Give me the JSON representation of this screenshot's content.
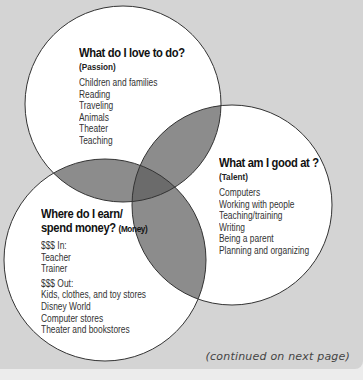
{
  "diagram": {
    "type": "venn",
    "colors": {
      "background": "#d4d4d4",
      "circle_fill": "#ffffff",
      "overlap_pair": "#8c8c8c",
      "overlap_triple": "#6b6b6b",
      "stroke": "#333333"
    },
    "passion": {
      "title": "What do I love to do?",
      "subtitle": "(Passion)",
      "items": [
        "Children and families",
        "Reading",
        "Traveling",
        "Animals",
        "Theater",
        "Teaching"
      ]
    },
    "talent": {
      "title": "What am I good at ?",
      "subtitle": "(Talent)",
      "items": [
        "Computers",
        "Working with people",
        "Teaching/training",
        "Writing",
        "Being a parent",
        "Planning and organizing"
      ]
    },
    "money": {
      "title_line1": "Where do I earn/",
      "title_line2": "spend money?",
      "subtitle": "(Money)",
      "in_label": "$$$ In:",
      "in_items": [
        "Teacher",
        "Trainer"
      ],
      "out_label": "$$$ Out:",
      "out_items": [
        "Kids, clothes, and toy stores",
        "Disney World",
        "Computer stores",
        "Theater and bookstores"
      ]
    }
  },
  "footer": {
    "continued": "(continued on next page)"
  }
}
